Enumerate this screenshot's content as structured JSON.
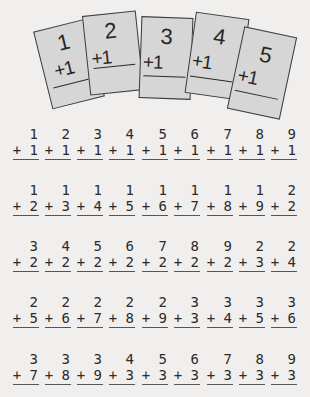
{
  "flashcards": [
    {
      "top": "1",
      "addend": "+1"
    },
    {
      "top": "2",
      "addend": "+1"
    },
    {
      "top": "3",
      "addend": "+1"
    },
    {
      "top": "4",
      "addend": "+1"
    },
    {
      "top": "5",
      "addend": "+1"
    }
  ],
  "problems": [
    [
      {
        "a": "1",
        "b": "+ 1"
      },
      {
        "a": "2",
        "b": "+ 1"
      },
      {
        "a": "3",
        "b": "+ 1"
      },
      {
        "a": "4",
        "b": "+ 1"
      },
      {
        "a": "5",
        "b": "+ 1"
      },
      {
        "a": "6",
        "b": "+ 1"
      },
      {
        "a": "7",
        "b": "+ 1"
      },
      {
        "a": "8",
        "b": "+ 1"
      },
      {
        "a": "9",
        "b": "+ 1"
      }
    ],
    [
      {
        "a": "1",
        "b": "+ 2"
      },
      {
        "a": "1",
        "b": "+ 3"
      },
      {
        "a": "1",
        "b": "+ 4"
      },
      {
        "a": "1",
        "b": "+ 5"
      },
      {
        "a": "1",
        "b": "+ 6"
      },
      {
        "a": "1",
        "b": "+ 7"
      },
      {
        "a": "1",
        "b": "+ 8"
      },
      {
        "a": "1",
        "b": "+ 9"
      },
      {
        "a": "2",
        "b": "+ 2"
      }
    ],
    [
      {
        "a": "3",
        "b": "+ 2"
      },
      {
        "a": "4",
        "b": "+ 2"
      },
      {
        "a": "5",
        "b": "+ 2"
      },
      {
        "a": "6",
        "b": "+ 2"
      },
      {
        "a": "7",
        "b": "+ 2"
      },
      {
        "a": "8",
        "b": "+ 2"
      },
      {
        "a": "9",
        "b": "+ 2"
      },
      {
        "a": "2",
        "b": "+ 3"
      },
      {
        "a": "2",
        "b": "+ 4"
      }
    ],
    [
      {
        "a": "2",
        "b": "+ 5"
      },
      {
        "a": "2",
        "b": "+ 6"
      },
      {
        "a": "2",
        "b": "+ 7"
      },
      {
        "a": "2",
        "b": "+ 8"
      },
      {
        "a": "2",
        "b": "+ 9"
      },
      {
        "a": "3",
        "b": "+ 3"
      },
      {
        "a": "3",
        "b": "+ 4"
      },
      {
        "a": "3",
        "b": "+ 5"
      },
      {
        "a": "3",
        "b": "+ 6"
      }
    ],
    [
      {
        "a": "3",
        "b": "+ 7"
      },
      {
        "a": "3",
        "b": "+ 8"
      },
      {
        "a": "3",
        "b": "+ 9"
      },
      {
        "a": "4",
        "b": "+ 3"
      },
      {
        "a": "5",
        "b": "+ 3"
      },
      {
        "a": "6",
        "b": "+ 3"
      },
      {
        "a": "7",
        "b": "+ 3"
      },
      {
        "a": "8",
        "b": "+ 3"
      },
      {
        "a": "9",
        "b": "+ 3"
      }
    ]
  ]
}
